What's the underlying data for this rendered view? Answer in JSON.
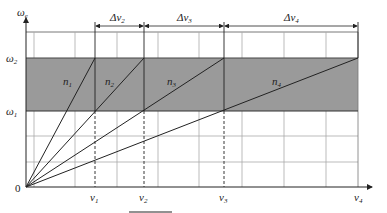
{
  "axes": {
    "y_label": "ω",
    "y_label_sub": "e",
    "origin_label": "0",
    "y_ticks": [
      {
        "label": "ω",
        "sub": "2"
      },
      {
        "label": "ω",
        "sub": "1"
      }
    ],
    "x_ticks": [
      {
        "label": "v",
        "sub": "1"
      },
      {
        "label": "v",
        "sub": "2"
      },
      {
        "label": "v",
        "sub": "3"
      },
      {
        "label": "v",
        "sub": "4"
      }
    ]
  },
  "lines": [
    {
      "label": "n",
      "sub": "1"
    },
    {
      "label": "n",
      "sub": "2"
    },
    {
      "label": "n",
      "sub": "3"
    },
    {
      "label": "n",
      "sub": "4"
    }
  ],
  "intervals": [
    {
      "label": "Δv",
      "sub": "2"
    },
    {
      "label": "Δv",
      "sub": "3"
    },
    {
      "label": "Δv",
      "sub": "4"
    }
  ],
  "colors": {
    "band": "#9a9a9a",
    "line": "#222222",
    "grid": "#aaaaaa"
  }
}
